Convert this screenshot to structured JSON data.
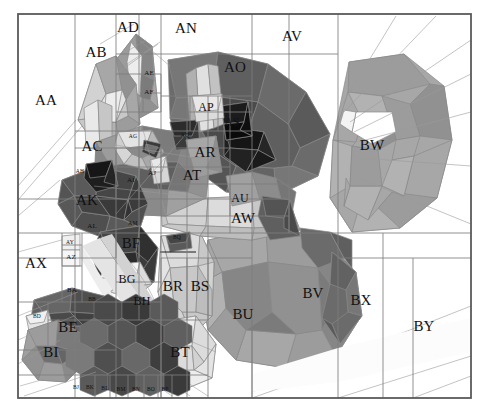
{
  "figure": {
    "kind": "labeled-low-poly-illustration",
    "palette_mode": "grayscale",
    "width": 489,
    "height": 412,
    "background": "#ffffff",
    "border_color": "#5a5a5a",
    "grid_color": "#7d7d7d",
    "edge_color": "#8a8a8a",
    "label_color": "#111111",
    "grays": {
      "g00": "#ffffff",
      "g01": "#fbfbfb",
      "g02": "#f4f4f4",
      "g03": "#ededed",
      "g04": "#e4e4e4",
      "g05": "#dcdcdc",
      "g06": "#d2d2d2",
      "g07": "#c8c8c8",
      "g08": "#bdbdbd",
      "g09": "#b2b2b2",
      "g10": "#a7a7a7",
      "g11": "#9c9c9c",
      "g12": "#919191",
      "g13": "#868686",
      "g14": "#7b7b7b",
      "g15": "#707070",
      "g16": "#656565",
      "g17": "#5a5a5a",
      "g18": "#4f4f4f",
      "g19": "#444444",
      "g20": "#393939",
      "g21": "#2e2e2e",
      "g22": "#232323",
      "g23": "#181818",
      "g24": "#0d0d0d"
    }
  },
  "frame": {
    "x": 18,
    "y": 14,
    "w": 453,
    "h": 384
  },
  "grid": {
    "vertical_x": [
      18,
      75,
      116,
      139,
      161,
      187,
      208,
      230,
      252,
      289,
      338,
      383,
      413,
      471
    ],
    "horizontal_y": [
      14,
      54,
      74,
      96,
      112,
      131,
      148,
      167,
      184,
      199,
      216,
      233,
      258,
      282,
      302,
      320,
      350,
      375,
      398
    ]
  },
  "labels": [
    {
      "text": "AA",
      "x": 46,
      "y": 100,
      "size": "big"
    },
    {
      "text": "AB",
      "x": 96,
      "y": 52,
      "size": "big"
    },
    {
      "text": "AC",
      "x": 92,
      "y": 146,
      "size": "big"
    },
    {
      "text": "AD",
      "x": 128,
      "y": 27,
      "size": "big"
    },
    {
      "text": "AE",
      "x": 149,
      "y": 73,
      "size": "sm"
    },
    {
      "text": "AF",
      "x": 149,
      "y": 92,
      "size": "sm"
    },
    {
      "text": "AG",
      "x": 133,
      "y": 137,
      "size": "xs"
    },
    {
      "text": "AH",
      "x": 80,
      "y": 172,
      "size": "xs"
    },
    {
      "text": "AI",
      "x": 131,
      "y": 180,
      "size": "sm"
    },
    {
      "text": "AJ",
      "x": 152,
      "y": 173,
      "size": "sm"
    },
    {
      "text": "AK",
      "x": 87,
      "y": 200,
      "size": "big"
    },
    {
      "text": "AL",
      "x": 92,
      "y": 226,
      "size": "sm"
    },
    {
      "text": "AM",
      "x": 133,
      "y": 224,
      "size": "xs"
    },
    {
      "text": "AN",
      "x": 186,
      "y": 28,
      "size": "big"
    },
    {
      "text": "AO",
      "x": 235,
      "y": 67,
      "size": "big"
    },
    {
      "text": "AP",
      "x": 206,
      "y": 107,
      "size": "mid"
    },
    {
      "text": "AQ",
      "x": 185,
      "y": 136,
      "size": "xs"
    },
    {
      "text": "AR",
      "x": 205,
      "y": 152,
      "size": "big"
    },
    {
      "text": "AS",
      "x": 232,
      "y": 122,
      "size": "mid"
    },
    {
      "text": "AT",
      "x": 192,
      "y": 175,
      "size": "big"
    },
    {
      "text": "AU",
      "x": 240,
      "y": 198,
      "size": "mid"
    },
    {
      "text": "AV",
      "x": 292,
      "y": 36,
      "size": "big"
    },
    {
      "text": "AW",
      "x": 243,
      "y": 218,
      "size": "big"
    },
    {
      "text": "AX",
      "x": 36,
      "y": 263,
      "size": "big"
    },
    {
      "text": "AY",
      "x": 70,
      "y": 243,
      "size": "xs"
    },
    {
      "text": "AZ",
      "x": 71,
      "y": 257,
      "size": "sm"
    },
    {
      "text": "BA",
      "x": 72,
      "y": 290,
      "size": "sm"
    },
    {
      "text": "BB",
      "x": 92,
      "y": 300,
      "size": "xs"
    },
    {
      "text": "BD",
      "x": 37,
      "y": 317,
      "size": "xs"
    },
    {
      "text": "BE",
      "x": 68,
      "y": 327,
      "size": "big"
    },
    {
      "text": "BF",
      "x": 131,
      "y": 243,
      "size": "big"
    },
    {
      "text": "BG",
      "x": 127,
      "y": 279,
      "size": "mid"
    },
    {
      "text": "BH",
      "x": 142,
      "y": 301,
      "size": "mid"
    },
    {
      "text": "BI",
      "x": 51,
      "y": 352,
      "size": "big"
    },
    {
      "text": "BJ",
      "x": 76,
      "y": 388,
      "size": "xs"
    },
    {
      "text": "BK",
      "x": 90,
      "y": 388,
      "size": "xs"
    },
    {
      "text": "BL",
      "x": 105,
      "y": 389,
      "size": "xs"
    },
    {
      "text": "BM",
      "x": 121,
      "y": 390,
      "size": "xs"
    },
    {
      "text": "BN",
      "x": 136,
      "y": 390,
      "size": "xs"
    },
    {
      "text": "BO",
      "x": 151,
      "y": 390,
      "size": "xs"
    },
    {
      "text": "BP",
      "x": 165,
      "y": 390,
      "size": "xs"
    },
    {
      "text": "BQ",
      "x": 177,
      "y": 238,
      "size": "xs"
    },
    {
      "text": "BR",
      "x": 173,
      "y": 286,
      "size": "big"
    },
    {
      "text": "BS",
      "x": 200,
      "y": 286,
      "size": "big"
    },
    {
      "text": "BT",
      "x": 180,
      "y": 352,
      "size": "big"
    },
    {
      "text": "BU",
      "x": 243,
      "y": 314,
      "size": "big"
    },
    {
      "text": "BV",
      "x": 313,
      "y": 293,
      "size": "big"
    },
    {
      "text": "BW",
      "x": 372,
      "y": 145,
      "size": "big"
    },
    {
      "text": "BX",
      "x": 361,
      "y": 300,
      "size": "big"
    },
    {
      "text": "BY",
      "x": 424,
      "y": 326,
      "size": "big"
    }
  ]
}
